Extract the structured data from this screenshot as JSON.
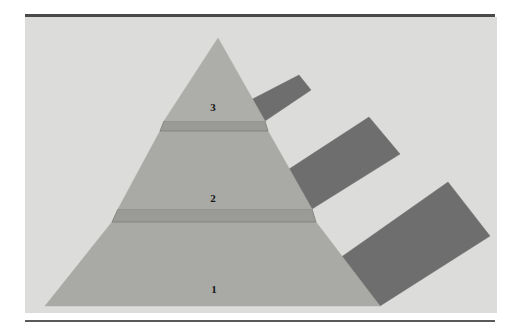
{
  "figure": {
    "background_color": "#ffffff",
    "panel_color": "#dcdcda",
    "rule_color": "#4a4a4a"
  },
  "colors": {
    "front_face": "#a9a9a5",
    "front_face_upper": "#adada9",
    "side_face": "#6e6e6e",
    "band": "#9a9a96",
    "band_edge": "#7c7c78",
    "label": "#161616",
    "panel": "#dcdcda"
  },
  "pyramid": {
    "tiers": [
      {
        "label": "1",
        "name": "tier-1-base",
        "label_x": 214,
        "label_y": 290,
        "front_face": "45,306 380,306 316,222 112,222",
        "side_face": "380,306 340,258 448,182 490,236",
        "top_band": "112,222 316,222 312,209 118,209",
        "order": 1
      },
      {
        "label": "2",
        "name": "tier-2-middle",
        "label_x": 213,
        "label_y": 199,
        "front_face": "118,209 312,209 268,131 160,131",
        "side_face": "312,209 283,173 369,117 400,154",
        "top_band": "160,131 268,131 265,121 164,121",
        "order": 2
      },
      {
        "label": "3",
        "name": "tier-3-apex",
        "label_x": 213,
        "label_y": 108,
        "front_face": "164,121 265,121 218,38",
        "side_face": "265,121 245,103 299,75 311,90",
        "top_band": "",
        "order": 3
      }
    ],
    "apex": {
      "x": 218,
      "y": 38
    },
    "base_left": {
      "x": 45,
      "y": 306
    },
    "base_right": {
      "x": 380,
      "y": 306
    }
  },
  "chart_data": {
    "type": "pyramid",
    "categories": [
      "1",
      "2",
      "3"
    ],
    "values": [
      1,
      2,
      3
    ],
    "labels": [
      "1",
      "2",
      "3"
    ],
    "orientation": "base-at-bottom",
    "level_count": 3
  }
}
